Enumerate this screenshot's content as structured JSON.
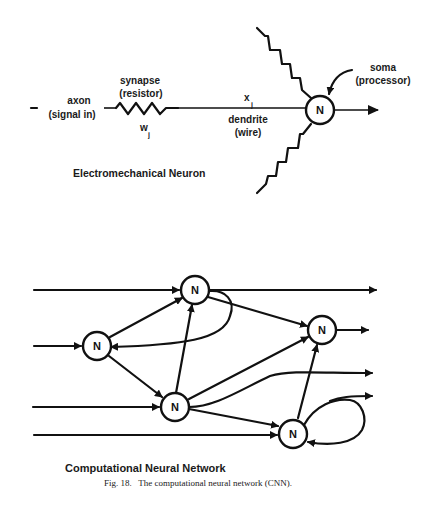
{
  "electromechanical_neuron": {
    "title": "Electromechanical Neuron",
    "labels": {
      "axon": "axon",
      "axon_sub": "(signal in)",
      "synapse": "synapse",
      "synapse_sub": "(resistor)",
      "weight": "w",
      "weight_sub": "j",
      "input": "x",
      "input_sub": "j",
      "dendrite": "dendrite",
      "dendrite_sub": "(wire)",
      "soma": "soma",
      "soma_sub": "(processor)"
    },
    "node_label": "N"
  },
  "computational_neural_network": {
    "title": "Computational Neural Network",
    "nodes": [
      {
        "id": "n1",
        "label": "N"
      },
      {
        "id": "n2",
        "label": "N"
      },
      {
        "id": "n3",
        "label": "N"
      },
      {
        "id": "n4",
        "label": "N"
      },
      {
        "id": "n5",
        "label": "N"
      }
    ]
  },
  "caption": "Fig. 18.   The computational neural network (CNN)."
}
